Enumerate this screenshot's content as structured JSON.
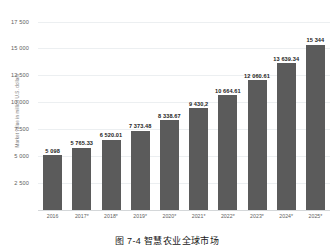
{
  "caption": "图 7-4  智慧农业全球市场",
  "colors": {
    "bar": "#5b5b5b",
    "gridline": "#eceff1",
    "axis_text": "#5e5e5e",
    "value_text": "#232323",
    "background": "#ffffff"
  },
  "chart_data": {
    "type": "bar",
    "title": "",
    "subtitle": "",
    "xlabel": "",
    "ylabel": "Market value in million U.S. dollars",
    "categories": [
      "2016",
      "2017*",
      "2018*",
      "2019*",
      "2020*",
      "2021*",
      "2022*",
      "2023*",
      "2024*",
      "2025*"
    ],
    "values": [
      5098,
      5765.33,
      6520.01,
      7373.48,
      8338.67,
      9430.2,
      10664.61,
      12060.61,
      13639.34,
      15344
    ],
    "value_labels": [
      "5 098",
      "5 765.33",
      "6 520.01",
      "7 373.48",
      "8 338.67",
      "9 430,2",
      "10 664.61",
      "12 060.61",
      "13 639.34",
      "15 344"
    ],
    "yticks": [
      2500,
      5000,
      7500,
      10000,
      12500,
      15000,
      17500
    ],
    "ytick_labels": [
      "2 500",
      "5 000",
      "7 500",
      "10 000",
      "12 500",
      "15 000",
      "17 500"
    ],
    "ylim": [
      0,
      18200
    ],
    "grid": true,
    "legend": null,
    "legend_position": "none",
    "series": [
      {
        "name": "Market value",
        "values": [
          5098,
          5765.33,
          6520.01,
          7373.48,
          8338.67,
          9430.2,
          10664.61,
          12060.61,
          13639.34,
          15344
        ]
      }
    ]
  }
}
